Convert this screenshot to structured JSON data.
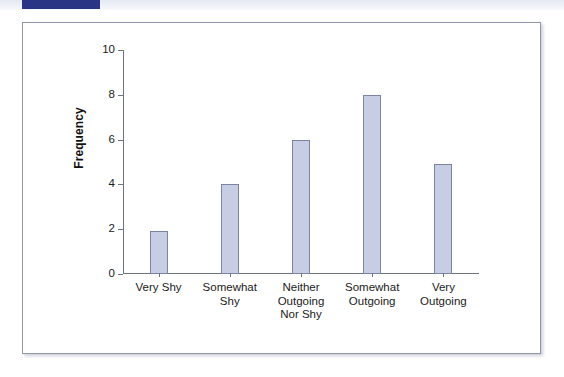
{
  "decor": {
    "band_accent_color": "#2a3585",
    "band_background_color": "#e7ebf3",
    "frame_border_color": "#8f96ad"
  },
  "chart_data": {
    "type": "bar",
    "title": "",
    "subtitle": "",
    "xlabel": "",
    "ylabel": "Frequency",
    "categories": [
      "Very Shy",
      "Somewhat\nShy",
      "Neither\nOutgoing\nNor Shy",
      "Somewhat\nOutgoing",
      "Very\nOutgoing"
    ],
    "values": [
      1.9,
      4,
      6,
      8,
      4.9
    ],
    "ylim": [
      0,
      10
    ],
    "yticks": [
      0,
      2,
      4,
      6,
      8,
      10
    ],
    "ytick_labels": [
      "0",
      "2",
      "4",
      "6",
      "8",
      "10"
    ],
    "grid": false,
    "legend": false,
    "legend_position": "none",
    "bar_fill_color": "#c7cee4",
    "bar_edge_color": "#7b84a6",
    "axis_color": "#6e7382",
    "plot_background_color": "#ffffff"
  }
}
